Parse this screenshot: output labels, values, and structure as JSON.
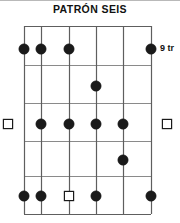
{
  "title": "PATRÓN SEIS",
  "fret_position_label": "9 tr",
  "colors": {
    "background": "#ffffff",
    "grid_line": "#5e5e5e",
    "grid_line_light": "#8a8a8a",
    "marker_fill": "#1a1a1a",
    "marker_hollow_fill": "#ffffff",
    "marker_hollow_stroke": "#1a1a1a",
    "text": "#111111",
    "top_rule": "#b9b9b9"
  },
  "diagram": {
    "type": "guitar-scale-pattern",
    "strings": 6,
    "frets": 5,
    "string_labels": [
      "1",
      "2",
      "3",
      "4",
      "5",
      "6"
    ],
    "fret_labels": [
      "1",
      "2",
      "3",
      "4",
      "5"
    ],
    "geometry": {
      "left": 24,
      "right": 151,
      "top": 26,
      "bottom": 214,
      "string_x": [
        24,
        41,
        69,
        96,
        123,
        151
      ],
      "fret_y": [
        26,
        65,
        103,
        141,
        176,
        214
      ]
    },
    "markers": [
      {
        "string": 1,
        "fret": 1,
        "shape": "filled",
        "cx": 24,
        "cy": 49
      },
      {
        "string": 2,
        "fret": 1,
        "shape": "filled",
        "cx": 41,
        "cy": 49
      },
      {
        "string": 3,
        "fret": 1,
        "shape": "filled",
        "cx": 69,
        "cy": 49
      },
      {
        "string": 6,
        "fret": 1,
        "shape": "filled",
        "cx": 151,
        "cy": 49
      },
      {
        "string": 4,
        "fret": 2,
        "shape": "filled",
        "cx": 96,
        "cy": 86
      },
      {
        "string": 1,
        "fret": 3,
        "shape": "hollow",
        "cx": 8,
        "cy": 124
      },
      {
        "string": 2,
        "fret": 3,
        "shape": "filled",
        "cx": 41,
        "cy": 124
      },
      {
        "string": 3,
        "fret": 3,
        "shape": "filled",
        "cx": 69,
        "cy": 124
      },
      {
        "string": 4,
        "fret": 3,
        "shape": "filled",
        "cx": 96,
        "cy": 124
      },
      {
        "string": 5,
        "fret": 3,
        "shape": "filled",
        "cx": 123,
        "cy": 124
      },
      {
        "string": 6,
        "fret": 3,
        "shape": "hollow",
        "cx": 167,
        "cy": 124
      },
      {
        "string": 5,
        "fret": 4,
        "shape": "filled",
        "cx": 123,
        "cy": 160
      },
      {
        "string": 1,
        "fret": 5,
        "shape": "filled",
        "cx": 24,
        "cy": 196
      },
      {
        "string": 2,
        "fret": 5,
        "shape": "filled",
        "cx": 41,
        "cy": 196
      },
      {
        "string": 3,
        "fret": 5,
        "shape": "hollow",
        "cx": 69,
        "cy": 196
      },
      {
        "string": 4,
        "fret": 5,
        "shape": "filled",
        "cx": 96,
        "cy": 196
      },
      {
        "string": 6,
        "fret": 5,
        "shape": "filled",
        "cx": 151,
        "cy": 196
      }
    ]
  }
}
